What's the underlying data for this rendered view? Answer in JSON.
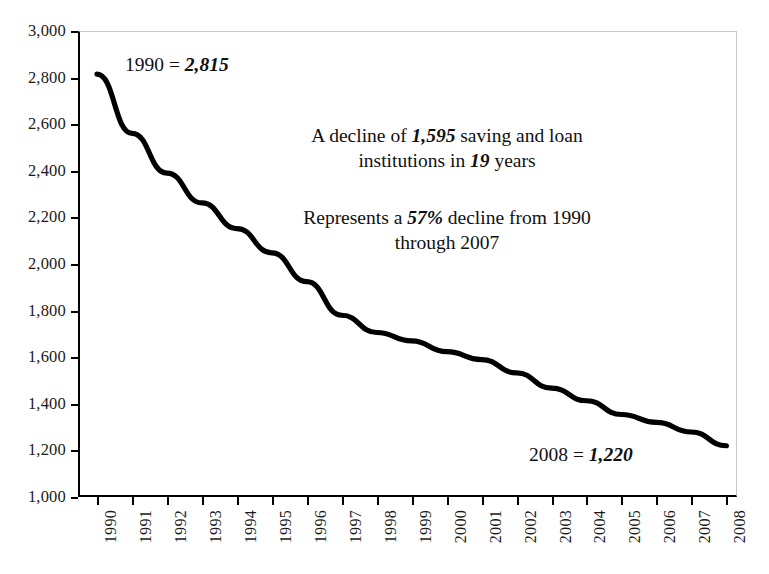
{
  "chart_data": {
    "type": "line",
    "title": "",
    "xlabel": "",
    "ylabel": "",
    "categories": [
      "1990",
      "1991",
      "1992",
      "1993",
      "1994",
      "1995",
      "1996",
      "1997",
      "1998",
      "1999",
      "2000",
      "2001",
      "2002",
      "2003",
      "2004",
      "2005",
      "2006",
      "2007",
      "2008"
    ],
    "values": [
      2815,
      2561,
      2390,
      2262,
      2152,
      2048,
      1924,
      1780,
      1706,
      1670,
      1624,
      1590,
      1533,
      1467,
      1413,
      1354,
      1320,
      1279,
      1220
    ],
    "series": [
      {
        "name": "Saving and loan institutions",
        "values": [
          2815,
          2561,
          2390,
          2262,
          2152,
          2048,
          1924,
          1780,
          1706,
          1670,
          1624,
          1590,
          1533,
          1467,
          1413,
          1354,
          1320,
          1279,
          1220
        ]
      }
    ],
    "ylim": [
      1000,
      3000
    ],
    "ytick_step": 200,
    "ytick_labels": [
      "3,000",
      "2,800",
      "2,600",
      "2,400",
      "2,200",
      "2,000",
      "1,800",
      "1,600",
      "1,400",
      "1,200",
      "1,000"
    ],
    "ytick_values": [
      3000,
      2800,
      2600,
      2400,
      2200,
      2000,
      1800,
      1600,
      1400,
      1200,
      1000
    ],
    "grid": false,
    "legend": "none",
    "line_color": "#000000",
    "frame_color": "#c8c8c8",
    "axis_color": "#000000"
  },
  "annotations": {
    "start": {
      "prefix": "1990 = ",
      "value": "2,815"
    },
    "decline": {
      "line1_a": "A decline of ",
      "line1_value": "1,595",
      "line1_b": " saving and loan",
      "line2_a": "institutions in ",
      "line2_value": "19",
      "line2_b": " years"
    },
    "percent": {
      "line1_a": "Represents a ",
      "line1_value": "57%",
      "line1_b": " decline from 1990",
      "line2": "through 2007"
    },
    "end": {
      "prefix": "2008 = ",
      "value": "1,220"
    }
  }
}
